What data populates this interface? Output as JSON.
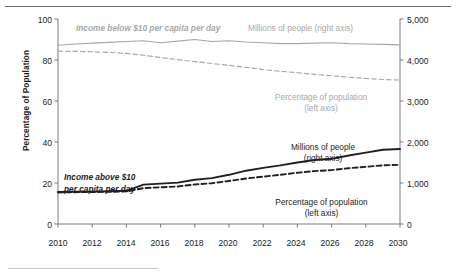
{
  "axes": {
    "left_title": "Percentage of Population",
    "right_title": "Millions of Persons",
    "left_ticks": [
      "100",
      "80",
      "60",
      "40",
      "20",
      "0"
    ],
    "right_ticks": [
      "5,000",
      "4,000",
      "3,000",
      "2,000",
      "1,000",
      "0"
    ],
    "x_ticks": [
      "2010",
      "2012",
      "2014",
      "2016",
      "2018",
      "2020",
      "2022",
      "2024",
      "2026",
      "2028",
      "2030"
    ]
  },
  "annotations": {
    "below_income": "Income below $10 per capita per day",
    "below_millions": "Millions of people (right axis)",
    "below_pct_l1": "Percentage of population",
    "below_pct_l2": "(left axis)",
    "above_income_l1": "Income above $10",
    "above_income_l2": "per capita per day",
    "above_millions_l1": "Millions of people",
    "above_millions_l2": "(right axis)",
    "above_pct_l1": "Percentage of population",
    "above_pct_l2": "(left axis)"
  },
  "colors": {
    "gray_series": "#a6a8ab",
    "black_series": "#231f20",
    "axis": "#6d6e71"
  },
  "chart_data": {
    "type": "line",
    "title": "",
    "xlabel": "",
    "ylabel": "Percentage of Population",
    "y2label": "Millions of Persons",
    "x": [
      2010,
      2011,
      2012,
      2013,
      2014,
      2015,
      2016,
      2017,
      2018,
      2019,
      2020,
      2021,
      2022,
      2023,
      2024,
      2025,
      2026,
      2027,
      2028,
      2029,
      2030
    ],
    "xlim": [
      2010,
      2030
    ],
    "ylim": [
      0,
      100
    ],
    "y2lim": [
      0,
      5000
    ],
    "grid": false,
    "legend": "annotations-inline",
    "series": [
      {
        "name": "Income below $10 per capita per day — Millions of people (right axis)",
        "axis": "right",
        "style": "solid",
        "color": "#a6a8ab",
        "units": "millions of persons",
        "values": [
          4360,
          4390,
          4410,
          4430,
          4450,
          4470,
          4420,
          4460,
          4500,
          4450,
          4470,
          4440,
          4420,
          4400,
          4400,
          4410,
          4420,
          4400,
          4390,
          4380,
          4370
        ]
      },
      {
        "name": "Income below $10 per capita per day — Percentage of population (left axis)",
        "axis": "left",
        "style": "dashed",
        "color": "#a6a8ab",
        "units": "percent",
        "values": [
          84.3,
          84.2,
          84.0,
          83.7,
          83.2,
          82.3,
          81.2,
          80.2,
          79.2,
          78.3,
          77.4,
          76.4,
          75.3,
          74.5,
          73.8,
          73.0,
          72.3,
          71.6,
          71.0,
          70.5,
          70.2
        ]
      },
      {
        "name": "Income above $10 per capita per day — Millions of people (right axis)",
        "axis": "right",
        "style": "solid",
        "color": "#231f20",
        "units": "millions of persons",
        "values": [
          780,
          785,
          790,
          800,
          810,
          960,
          985,
          1010,
          1080,
          1120,
          1200,
          1300,
          1370,
          1430,
          1500,
          1560,
          1590,
          1670,
          1740,
          1810,
          1830
        ]
      },
      {
        "name": "Income above $10 per capita per day — Percentage of population (left axis)",
        "axis": "left",
        "style": "dashed",
        "color": "#231f20",
        "units": "percent",
        "values": [
          15.4,
          15.5,
          15.6,
          15.7,
          15.9,
          17.5,
          17.9,
          18.3,
          19.3,
          19.9,
          21.0,
          22.2,
          23.1,
          24.0,
          25.0,
          25.8,
          26.3,
          27.2,
          27.9,
          28.6,
          28.9
        ]
      }
    ]
  }
}
